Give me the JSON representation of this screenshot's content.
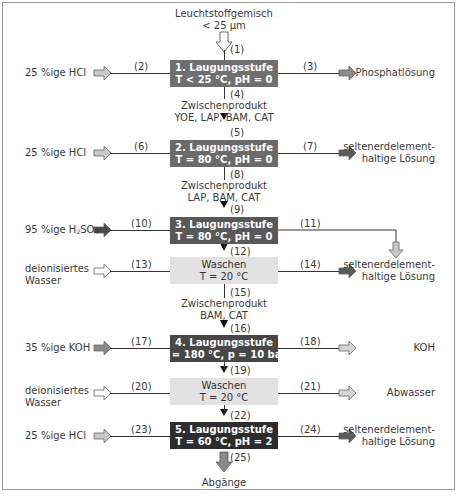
{
  "input": {
    "label_line1": "Leuchtstoffgemisch",
    "label_line2": "< 25 µm"
  },
  "stages": [
    {
      "id": "stage1",
      "line1": "1. Laugungsstufe",
      "line2": "T < 25 °C, pH = 0",
      "color": "#6f6f6f",
      "text_color": "#ffffff"
    },
    {
      "id": "stage2",
      "line1": "2. Laugungsstufe",
      "line2": "T = 80 °C, pH = 0",
      "color": "#6a6a6a",
      "text_color": "#ffffff"
    },
    {
      "id": "stage3",
      "line1": "3. Laugungsstufe",
      "line2": "T = 80 °C, pH = 0",
      "color": "#585858",
      "text_color": "#ffffff"
    },
    {
      "id": "wash1",
      "line1": "Waschen",
      "line2": "T = 20 °C",
      "color": "#e2e2e2",
      "text_color": "#333333"
    },
    {
      "id": "stage4",
      "line1": "4. Laugungsstufe",
      "line2": "T = 180 °C, p = 10 bar",
      "color": "#474747",
      "text_color": "#ffffff"
    },
    {
      "id": "wash2",
      "line1": "Waschen",
      "line2": "T = 20 °C",
      "color": "#e2e2e2",
      "text_color": "#333333"
    },
    {
      "id": "stage5",
      "line1": "5. Laugungsstufe",
      "line2": "T = 60 °C, pH = 2",
      "color": "#2d2d2d",
      "text_color": "#ffffff"
    }
  ],
  "inputs_left": [
    {
      "stage": "stage1",
      "label": "25 %ige HCl",
      "stream": "(2)"
    },
    {
      "stage": "stage2",
      "label": "25 %ige HCl",
      "stream": "(6)"
    },
    {
      "stage": "stage3",
      "label_prefix": "95 %ige H",
      "sub1": "2",
      "mid": "SO",
      "sub2": "4",
      "stream": "(10)"
    },
    {
      "stage": "wash1",
      "label_line1": "deionisiertes",
      "label_line2": "Wasser",
      "stream": "(13)"
    },
    {
      "stage": "stage4",
      "label": "35 %ige KOH",
      "stream": "(17)"
    },
    {
      "stage": "wash2",
      "label_line1": "deionisiertes",
      "label_line2": "Wasser",
      "stream": "(20)"
    },
    {
      "stage": "stage5",
      "label": "25 %ige HCl",
      "stream": "(23)"
    }
  ],
  "outputs_right": [
    {
      "stage": "stage1",
      "label": "Phosphatlösung",
      "stream": "(3)"
    },
    {
      "stage": "stage2",
      "label_line1": "seltenerdelement-",
      "label_line2": "haltige Lösung",
      "stream": "(7)"
    },
    {
      "stage": "stage3",
      "stream": "(11)"
    },
    {
      "stage": "wash1",
      "label_line1": "seltenerdelement-",
      "label_line2": "haltige Lösung",
      "stream": "(14)"
    },
    {
      "stage": "stage4",
      "label": "KOH",
      "stream": "(18)"
    },
    {
      "stage": "wash2",
      "label": "Abwasser",
      "stream": "(21)"
    },
    {
      "stage": "stage5",
      "label_line1": "seltenerdelement-",
      "label_line2": "haltige Lösung",
      "stream": "(24)"
    }
  ],
  "vertical_streams": {
    "s1": "(1)",
    "s4": "(4)",
    "s5": "(5)",
    "s8": "(8)",
    "s9": "(9)",
    "s12": "(12)",
    "s15": "(15)",
    "s16": "(16)",
    "s19": "(19)",
    "s22": "(22)",
    "s25": "(25)"
  },
  "intermediates": [
    {
      "line1": "Zwischenprodukt",
      "line2": "YOE, LAP, BAM, CAT"
    },
    {
      "line1": "Zwischenprodukt",
      "line2": "LAP, BAM, CAT"
    },
    {
      "line1": "Zwischenprodukt",
      "line2": "BAM, CAT"
    }
  ],
  "output_bottom": {
    "label": "Abgänge"
  },
  "arrow_colors": {
    "white": "#ffffff",
    "light": "#c8c8c8",
    "medium": "#8a8a8a",
    "dark": "#5a5a5a",
    "darkest": "#3a3a3a"
  }
}
